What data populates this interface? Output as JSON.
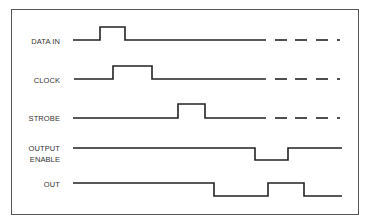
{
  "diagram": {
    "type": "timing-diagram",
    "frame": {
      "x": 11,
      "y": 9,
      "w": 348,
      "h": 206,
      "color": "#555555"
    },
    "line_color": "#222222",
    "signals": [
      {
        "id": "data_in",
        "label": "DATA IN",
        "label_lines": [
          "DATA IN"
        ],
        "label_y": 41,
        "low_y": 40,
        "high_y": 27,
        "points": [
          [
            73,
            40
          ],
          [
            100,
            40
          ],
          [
            100,
            27
          ],
          [
            125,
            27
          ],
          [
            125,
            40
          ],
          [
            266,
            40
          ]
        ],
        "dashes": [
          [
            275,
            287
          ],
          [
            295,
            307
          ],
          [
            316,
            328
          ],
          [
            337,
            340
          ]
        ]
      },
      {
        "id": "clock",
        "label": "CLOCK",
        "label_lines": [
          "CLOCK"
        ],
        "label_y": 80,
        "low_y": 79,
        "high_y": 66,
        "points": [
          [
            74,
            79
          ],
          [
            113,
            79
          ],
          [
            113,
            66
          ],
          [
            152,
            66
          ],
          [
            152,
            79
          ],
          [
            266,
            79
          ]
        ],
        "dashes": [
          [
            275,
            287
          ],
          [
            295,
            307
          ],
          [
            316,
            328
          ],
          [
            337,
            340
          ]
        ]
      },
      {
        "id": "strobe",
        "label": "STROBE",
        "label_lines": [
          "STROBE"
        ],
        "label_y": 118,
        "low_y": 118,
        "high_y": 104,
        "points": [
          [
            73,
            118
          ],
          [
            178,
            118
          ],
          [
            178,
            104
          ],
          [
            205,
            104
          ],
          [
            205,
            118
          ],
          [
            266,
            118
          ]
        ],
        "dashes": [
          [
            275,
            287
          ],
          [
            295,
            307
          ],
          [
            316,
            328
          ],
          [
            337,
            340
          ]
        ]
      },
      {
        "id": "output_enable",
        "label": "OUTPUT ENABLE",
        "label_lines": [
          "OUTPUT",
          "ENABLE"
        ],
        "label_y": 154,
        "low_y": 160,
        "high_y": 148,
        "points": [
          [
            73,
            148
          ],
          [
            255,
            148
          ],
          [
            255,
            160
          ],
          [
            288,
            160
          ],
          [
            288,
            148
          ],
          [
            342,
            148
          ]
        ],
        "dashes": []
      },
      {
        "id": "out",
        "label": "OUT",
        "label_lines": [
          "OUT"
        ],
        "label_y": 184,
        "low_y": 196,
        "high_y": 183,
        "points": [
          [
            73,
            183
          ],
          [
            214,
            183
          ],
          [
            214,
            196
          ],
          [
            268,
            196
          ],
          [
            268,
            183
          ],
          [
            304,
            183
          ],
          [
            304,
            196
          ],
          [
            342,
            196
          ]
        ],
        "dashes": []
      }
    ]
  }
}
